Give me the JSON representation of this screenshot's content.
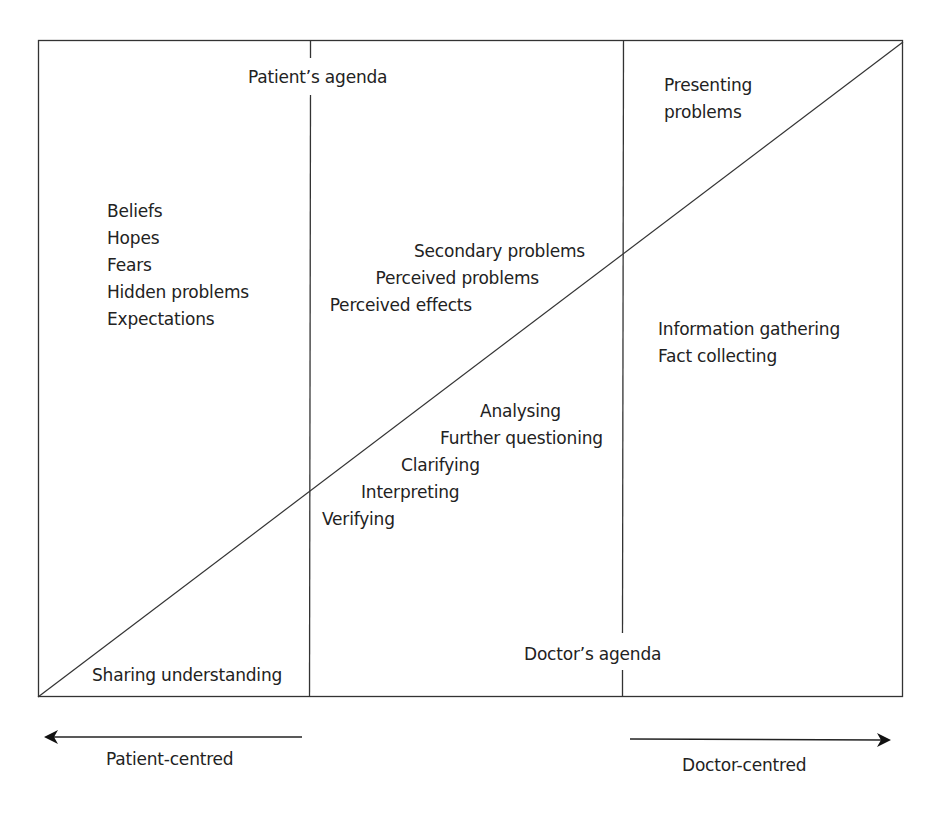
{
  "diagram": {
    "type": "consultation-agenda-model",
    "colors": {
      "line": "#333333",
      "text": "#222222",
      "background": "#ffffff"
    },
    "headings": {
      "patient_agenda": "Patient’s agenda",
      "doctor_agenda": "Doctor’s agenda"
    },
    "left_column": {
      "items": [
        "Beliefs",
        "Hopes",
        "Fears",
        "Hidden problems",
        "Expectations"
      ],
      "bottom_label": "Sharing understanding"
    },
    "middle_column": {
      "upper_items": [
        "Secondary problems",
        "Perceived problems",
        "Perceived effects"
      ],
      "lower_items": [
        "Analysing",
        "Further questioning",
        "Clarifying",
        "Interpreting",
        "Verifying"
      ]
    },
    "right_column": {
      "top_label": [
        "Presenting",
        "problems"
      ],
      "items": [
        "Information gathering",
        "Fact collecting"
      ]
    },
    "axis": {
      "left_arrow_label": "Patient-centred",
      "right_arrow_label": "Doctor-centred"
    }
  }
}
